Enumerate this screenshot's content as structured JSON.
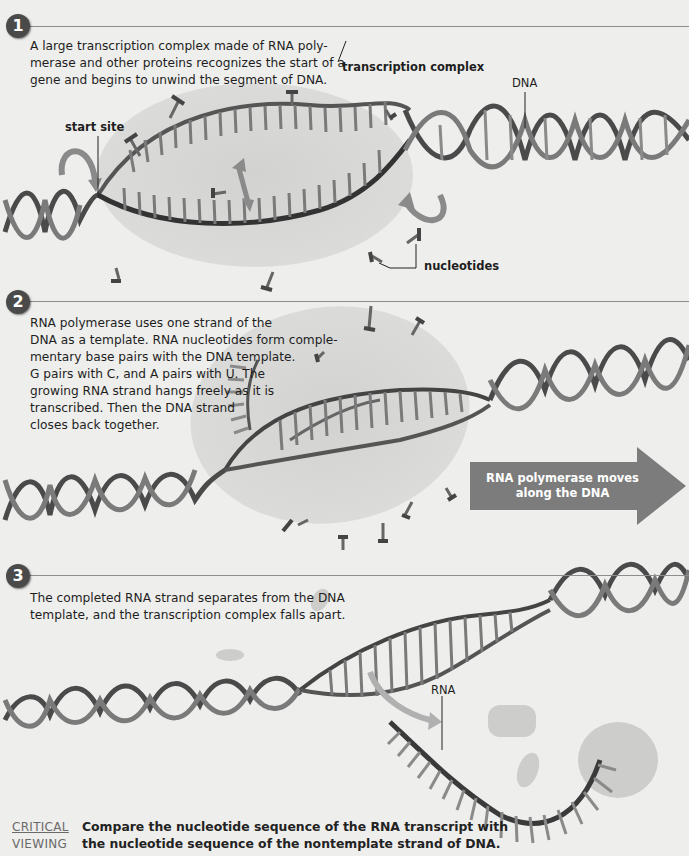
{
  "figure": {
    "heading_partial": "",
    "steps": [
      {
        "number": "1",
        "text": [
          "A large transcription complex made of RNA poly-",
          "merase and other proteins recognizes the start of a",
          "gene and begins to unwind the segment of DNA."
        ],
        "labels": {
          "transcription_complex": "transcription complex",
          "dna": "DNA",
          "start_site": "start site",
          "nucleotides": "nucleotides"
        }
      },
      {
        "number": "2",
        "text": [
          "RNA polymerase uses one strand of the",
          "DNA as a template. RNA nucleotides form comple-",
          "mentary base pairs with the DNA template.",
          "G pairs with C, and A pairs with U. The",
          "growing RNA strand hangs freely as it is",
          "transcribed. Then the DNA strand",
          "closes back together."
        ],
        "arrow_banner": [
          "RNA polymerase moves",
          "along the DNA"
        ]
      },
      {
        "number": "3",
        "text": [
          "The completed RNA strand separates from the DNA",
          "template, and the transcription complex falls apart."
        ],
        "labels": {
          "rna": "RNA"
        }
      }
    ],
    "critical_viewing": {
      "label_line1": "CRITICAL",
      "label_line2": "VIEWING",
      "question_line1": "Compare the nucleotide sequence of the RNA transcript with",
      "question_line2": "the nucleotide sequence of the nontemplate strand of DNA."
    }
  },
  "colors": {
    "background": "#eeeeec",
    "complex_blob": "#d4d4d2",
    "dna_dark": "#4d4d4d",
    "dna_light": "#8e8e8e",
    "arrow_banner": "#7c7c7c",
    "badge": "#4a4a4a"
  }
}
